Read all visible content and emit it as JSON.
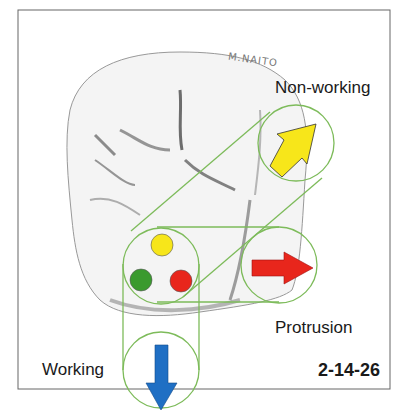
{
  "figure": {
    "id_label": "2-14-26",
    "signature": "M.NAITO"
  },
  "labels": {
    "non_working": "Non-working",
    "protrusion": "Protrusion",
    "working": "Working"
  },
  "contact_dots": [
    {
      "name": "yellow-dot",
      "color": "#f7e61a"
    },
    {
      "name": "green-dot",
      "color": "#3a9a2e"
    },
    {
      "name": "red-dot",
      "color": "#e8261c"
    }
  ],
  "arrows": [
    {
      "name": "non-working-arrow",
      "direction": "up-right",
      "color": "#f7e61a"
    },
    {
      "name": "protrusion-arrow",
      "direction": "right",
      "color": "#e8261c"
    },
    {
      "name": "working-arrow",
      "direction": "down",
      "color": "#1f6fc4"
    }
  ],
  "colors": {
    "connector": "#7dbb5a",
    "frame": "#666666"
  }
}
